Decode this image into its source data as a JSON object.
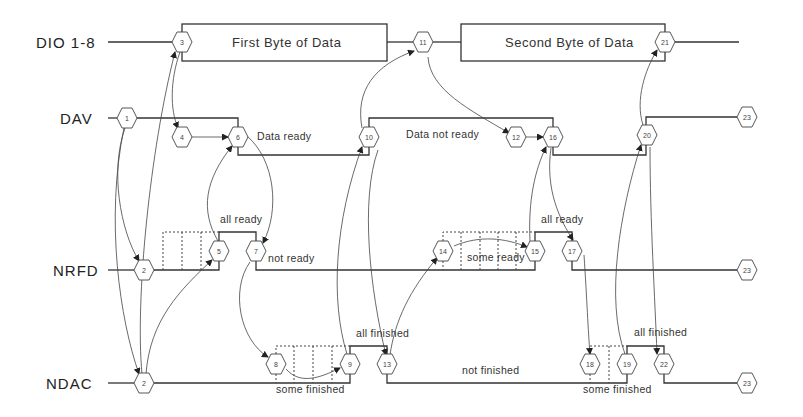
{
  "signals": [
    {
      "name": "DIO 1-8",
      "y": 42
    },
    {
      "name": "DAV",
      "y": 118
    },
    {
      "name": "NRFD",
      "y": 270
    },
    {
      "name": "NDAC",
      "y": 383
    }
  ],
  "data_boxes": [
    {
      "label": "First Byte of Data",
      "x1": 182,
      "x2": 387,
      "y1": 24,
      "y2": 61
    },
    {
      "label": "Second Byte of Data",
      "x1": 461,
      "x2": 665,
      "y1": 24,
      "y2": 61
    }
  ],
  "annotations": [
    {
      "text": "Data ready",
      "x": 257,
      "y": 140
    },
    {
      "text": "Data not ready",
      "x": 406,
      "y": 138
    },
    {
      "text": "all ready",
      "x": 220,
      "y": 223
    },
    {
      "text": "not ready",
      "x": 268,
      "y": 262
    },
    {
      "text": "all ready",
      "x": 541,
      "y": 223
    },
    {
      "text": "some ready",
      "x": 467,
      "y": 261
    },
    {
      "text": "all finished",
      "x": 356,
      "y": 337
    },
    {
      "text": "some finished",
      "x": 276,
      "y": 393
    },
    {
      "text": "not finished",
      "x": 462,
      "y": 374
    },
    {
      "text": "all finished",
      "x": 634,
      "y": 336
    },
    {
      "text": "some finished",
      "x": 583,
      "y": 393
    }
  ],
  "nodes": [
    {
      "id": "1",
      "x": 127,
      "y": 118
    },
    {
      "id": "2",
      "x": 144,
      "y": 270
    },
    {
      "id": "2",
      "x": 144,
      "y": 383
    },
    {
      "id": "3",
      "x": 182,
      "y": 42
    },
    {
      "id": "4",
      "x": 182,
      "y": 137
    },
    {
      "id": "5",
      "x": 219,
      "y": 251
    },
    {
      "id": "6",
      "x": 238,
      "y": 137
    },
    {
      "id": "7",
      "x": 256,
      "y": 251
    },
    {
      "id": "8",
      "x": 276,
      "y": 364
    },
    {
      "id": "9",
      "x": 350,
      "y": 364
    },
    {
      "id": "10",
      "x": 369,
      "y": 137
    },
    {
      "id": "11",
      "x": 423,
      "y": 42
    },
    {
      "id": "12",
      "x": 516,
      "y": 137
    },
    {
      "id": "13",
      "x": 387,
      "y": 364
    },
    {
      "id": "14",
      "x": 443,
      "y": 251
    },
    {
      "id": "15",
      "x": 535,
      "y": 251
    },
    {
      "id": "16",
      "x": 553,
      "y": 137
    },
    {
      "id": "17",
      "x": 572,
      "y": 251
    },
    {
      "id": "18",
      "x": 590,
      "y": 364
    },
    {
      "id": "19",
      "x": 627,
      "y": 364
    },
    {
      "id": "20",
      "x": 647,
      "y": 135
    },
    {
      "id": "21",
      "x": 665,
      "y": 42
    },
    {
      "id": "22",
      "x": 664,
      "y": 364
    },
    {
      "id": "23",
      "x": 747,
      "y": 117
    },
    {
      "id": "23",
      "x": 747,
      "y": 270
    },
    {
      "id": "23",
      "x": 747,
      "y": 383
    }
  ]
}
